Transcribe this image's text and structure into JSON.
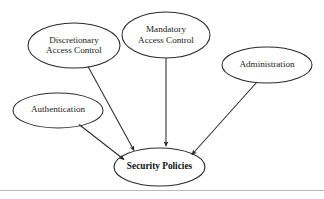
{
  "diagram": {
    "background_color": "#ffffff",
    "stroke_color": "#2b2b2b",
    "text_color": "#1a1a1a",
    "nodes": [
      {
        "id": "discretionary-access-control",
        "label": "Discretionary\nAccess Control",
        "lines": [
          "Discretionary",
          "Access Control"
        ],
        "shape": "ellipse",
        "cx": 74,
        "cy": 45.5,
        "rx": 46,
        "ry": 22.5
      },
      {
        "id": "mandatory-access-control",
        "label": "Mandatory\nAccess Control",
        "lines": [
          "Mandatory",
          "Access Control"
        ],
        "shape": "ellipse",
        "cx": 166,
        "cy": 35,
        "rx": 44,
        "ry": 23
      },
      {
        "id": "administration",
        "label": "Administration",
        "lines": [
          "Administration"
        ],
        "shape": "ellipse",
        "cx": 267,
        "cy": 65,
        "rx": 45,
        "ry": 18
      },
      {
        "id": "authentication",
        "label": "Authentication",
        "lines": [
          "Authentication"
        ],
        "shape": "ellipse",
        "cx": 58,
        "cy": 110.5,
        "rx": 45,
        "ry": 17.5
      },
      {
        "id": "security-policies",
        "label": "Security Policies",
        "lines": [
          "Security Policies"
        ],
        "shape": "ellipse",
        "cx": 159.5,
        "cy": 167,
        "rx": 45.5,
        "ry": 19
      }
    ],
    "edges": [
      {
        "id": "edge-discretionary-to-security-policies",
        "from": "discretionary-access-control",
        "to": "security-policies",
        "arrowhead": "filled-triangle"
      },
      {
        "id": "edge-mandatory-to-security-policies",
        "from": "mandatory-access-control",
        "to": "security-policies",
        "arrowhead": "filled-triangle"
      },
      {
        "id": "edge-administration-to-security-policies",
        "from": "administration",
        "to": "security-policies",
        "arrowhead": "filled-triangle"
      },
      {
        "id": "edge-authentication-to-security-policies",
        "from": "authentication",
        "to": "security-policies",
        "arrowhead": "filled-triangle"
      }
    ],
    "footer_rule": {
      "visible": true,
      "color": "#b9b9b9"
    }
  }
}
